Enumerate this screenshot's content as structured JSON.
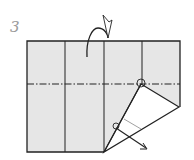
{
  "diagram": {
    "step_number": "3",
    "type": "origami fold diagram",
    "colors": {
      "paper": "#e6e6e6",
      "line": "#222222",
      "flap": "#ffffff",
      "step_label": "#9a9a9a"
    }
  }
}
